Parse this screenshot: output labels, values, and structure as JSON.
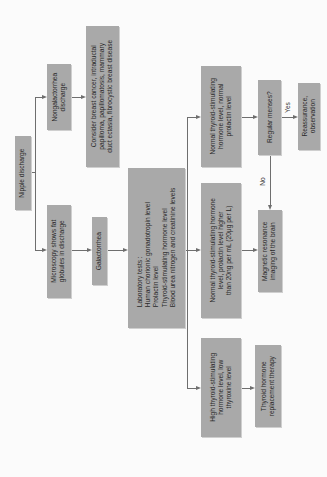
{
  "diagram": {
    "type": "flowchart",
    "orientation": "rotated-90-ccw",
    "nodes": {
      "nipple_discharge": "Nipple discharge",
      "nongalactorrhea": "Nongalactorrhea\ndischarge",
      "consider_cancer": "Consider breast cancer, intraductal\npapilloma, papillomatosis, mammary\nduct ectasia, fibrocystic breast disease",
      "microscopy": "Microscopy shows fat\nglobules in discharge",
      "galactorrhea": "Galactorrhea",
      "lab_tests": "Laboratory tests :\nHuman chorionic gonadotropin level\nProlactin level\nThyroid-stimulating hormone level\nBlood urea nitrogen and creatinine levels",
      "normal_tsh_normal_prl": "Normal thyroid-stimulating\nhormone level, normal\nprolactin level",
      "normal_tsh_high_prl": "Normal thyroid-stimulating hormone\nlevel, prolactin level higher\nthan 20ng per mL (20μg per L)",
      "high_tsh": "High thyroid-stimulating\nhormone level, low\nthyroxine level",
      "regular_menses": "Regular menses?",
      "reassurance": "Reassurance,\nobservation",
      "mri": "Magnetic resonance\nimaging of the brain",
      "thyroid_therapy": "Thyroid hormone\nreplacement therapy"
    },
    "edge_labels": {
      "yes": "Yes",
      "no": "No"
    },
    "colors": {
      "box": "#a9a9a9",
      "line": "#6e6e6e",
      "background": "#fbfbfb"
    }
  }
}
